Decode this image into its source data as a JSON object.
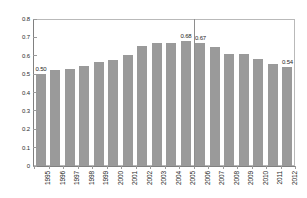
{
  "chart_data": {
    "type": "bar",
    "title": "",
    "subtitle": "",
    "xlabel": "",
    "ylabel": "",
    "categories": [
      "1995",
      "1996",
      "1997",
      "1998",
      "1999",
      "2000",
      "2001",
      "2002",
      "2003",
      "2004",
      "2005",
      "2006",
      "2007",
      "2008",
      "2009",
      "2010",
      "2011",
      "2012"
    ],
    "values": [
      0.5,
      0.52,
      0.53,
      0.545,
      0.565,
      0.575,
      0.605,
      0.655,
      0.67,
      0.67,
      0.68,
      0.67,
      0.65,
      0.61,
      0.61,
      0.585,
      0.555,
      0.54
    ],
    "point_labels": [
      "0.50",
      "",
      "",
      "",
      "",
      "",
      "",
      "",
      "",
      "",
      "0.68",
      "0.67",
      "",
      "",
      "",
      "",
      "",
      "0.54"
    ],
    "ylim": [
      0,
      0.8
    ],
    "y_ticks": [
      "0",
      "0.1",
      "0.2",
      "0.3",
      "0.4",
      "0.5",
      "0.6",
      "0.7",
      "0.8"
    ],
    "y_tick_values": [
      0,
      0.1,
      0.2,
      0.3,
      0.4,
      0.5,
      0.6,
      0.7,
      0.8
    ],
    "grid": false,
    "legend": "none",
    "bar_color": "#9a9a9a",
    "axis_color": "#808080",
    "frame_color": "#b9b9b9",
    "annotations": [
      {
        "name": "period-divider",
        "kind": "vertical-line",
        "between": [
          "2005",
          "2006"
        ],
        "color": "#8e8e8e"
      }
    ]
  }
}
